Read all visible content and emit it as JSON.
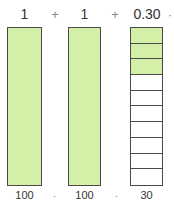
{
  "equation": {
    "terms": [
      "1",
      "1",
      "0.30"
    ],
    "operators": [
      "+",
      "+"
    ],
    "trailing": "·"
  },
  "blocks": [
    {
      "type": "whole",
      "filled": true,
      "label": "100"
    },
    {
      "type": "whole",
      "filled": true,
      "label": "100"
    },
    {
      "type": "tenths",
      "cells": 10,
      "filled_cells": 3,
      "label": "30"
    }
  ],
  "separators": [
    ".",
    "."
  ],
  "colors": {
    "fill": "#d4f0a8",
    "border": "#4a4a4a"
  }
}
